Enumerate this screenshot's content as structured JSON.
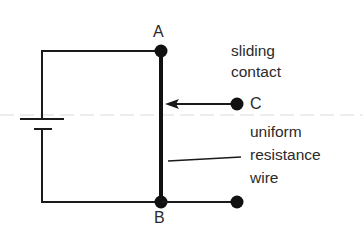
{
  "diagram": {
    "type": "circuit",
    "labels": {
      "node_a": "A",
      "node_b": "B",
      "node_c": "C",
      "sliding_contact_line1": "sliding",
      "sliding_contact_line2": "contact",
      "wire_line1": "uniform",
      "wire_line2": "resistance",
      "wire_line3": "wire"
    },
    "components": [
      {
        "id": "cell",
        "kind": "battery-cell",
        "position": "left branch"
      },
      {
        "id": "wire_ab",
        "kind": "uniform-resistance-wire",
        "from": "A",
        "to": "B"
      },
      {
        "id": "contact_c",
        "kind": "sliding-contact",
        "terminal": "C",
        "touches": "wire_ab"
      },
      {
        "id": "terminal_b_out",
        "kind": "terminal",
        "connected_to": "B"
      }
    ],
    "colors": {
      "line": "#1a1a1a",
      "text": "#2a2a2a",
      "background": "#ffffff",
      "faint_guide": "#e6e6e6"
    }
  }
}
